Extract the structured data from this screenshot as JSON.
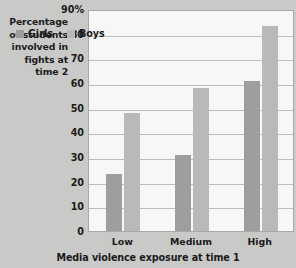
{
  "chart_data": {
    "type": "bar",
    "title": "",
    "xlabel": "Media violence exposure at time 1",
    "ylabel": "Percentage of students involved in fights at time 2",
    "categories": [
      "Low",
      "Medium",
      "High"
    ],
    "series": [
      {
        "name": "Girls",
        "values": [
          23,
          31,
          61
        ],
        "color": "#9e9e9c"
      },
      {
        "name": "Boys",
        "values": [
          48,
          58,
          83
        ],
        "color": "#b9b9b7"
      }
    ],
    "ylim": [
      0,
      90
    ],
    "ytick_labels": [
      "90%",
      "80",
      "70",
      "60",
      "50",
      "40",
      "30",
      "20",
      "10",
      "0"
    ],
    "ytick_values": [
      90,
      80,
      70,
      60,
      50,
      40,
      30,
      20,
      10,
      0
    ],
    "grid": true,
    "legend_position": "top-left-inside",
    "background": "#c9c9c7",
    "plot_background": "#f7f7f5"
  }
}
